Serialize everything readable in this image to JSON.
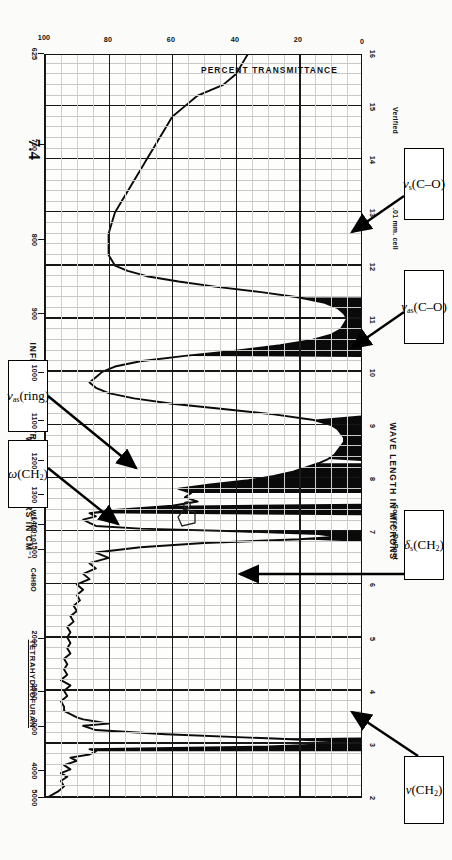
{
  "document": {
    "title": "INFRA-RED SPECTROGRAM",
    "compound_name": "TETRAHYDROFURAN",
    "formula": "C4H8O",
    "mol_wt_label": "Mol. Wt. 72.10",
    "mp_label": "MP 66.2-66.4°C",
    "source_label": "Source: DuPont",
    "cell_label": ".01 mm. cell",
    "verified_label": "Verified",
    "hand_marks": {
      "wavelength_note": "7.4"
    }
  },
  "axes": {
    "x_top": {
      "name": "WAVE NUMBERS IN CM⁻¹",
      "ticks": [
        "5000",
        "4000",
        "3000",
        "2500",
        "2000",
        "1500",
        "1400",
        "1300",
        "1200",
        "1100",
        "1000",
        "900",
        "800",
        "700",
        "625"
      ]
    },
    "x_bottom": {
      "name": "WAVE LENGTH IN MICRONS",
      "ticks": [
        "2",
        "3",
        "4",
        "5",
        "6",
        "7",
        "8",
        "9",
        "10",
        "11",
        "12",
        "13",
        "14",
        "15",
        "16"
      ]
    },
    "y": {
      "name": "PERCENT TRANSMITTANCE",
      "ticks": [
        "100",
        "80",
        "60",
        "40",
        "20",
        "0"
      ],
      "range": [
        0,
        100
      ]
    }
  },
  "annotations": [
    {
      "id": "nu-ch2",
      "label_html": "<i>ν</i>(CH<sub>2</sub>)",
      "plain": "nu(CH2)"
    },
    {
      "id": "delta-ch2",
      "label_html": "<i>δ</i><sub>s</sub>(CH<sub>2</sub>)",
      "plain": "delta_s(CH2)"
    },
    {
      "id": "omega-ch2",
      "label_html": "<i>ω</i>(CH<sub>2</sub>)",
      "plain": "omega(CH2)"
    },
    {
      "id": "nuas-ring",
      "label_html": "<i>ν</i><sub>as</sub>(ring)",
      "plain": "nu_as(ring)"
    },
    {
      "id": "nuas-co",
      "label_html": "<i>ν</i><sub>as</sub>(C–O)",
      "plain": "nu_as(C-O)"
    },
    {
      "id": "nus-co",
      "label_html": "<i>ν</i><sub>s</sub>(C–O)",
      "plain": "nu_s(C-O)"
    }
  ],
  "chart_data": {
    "type": "line",
    "title": "INFRA-RED SPECTROGRAM",
    "subtitle": "TETRAHYDROFURAN",
    "xlabel": "WAVE LENGTH IN MICRONS",
    "xlabel_secondary": "WAVE NUMBERS IN CM-1",
    "ylabel": "PERCENT TRANSMITTANCE",
    "xlim": [
      2,
      16
    ],
    "ylim": [
      0,
      100
    ],
    "grid": true,
    "legend": "none",
    "fill_below_curve": true,
    "x_unit": "microns",
    "y_unit": "percent transmittance",
    "x": [
      2.0,
      2.1,
      2.2,
      2.3,
      2.38,
      2.45,
      2.52,
      2.6,
      2.68,
      2.74,
      2.8,
      2.86,
      2.9,
      2.95,
      3.0,
      3.05,
      3.1,
      3.18,
      3.26,
      3.34,
      3.38,
      3.42,
      3.46,
      3.5,
      3.56,
      3.62,
      3.7,
      3.8,
      3.9,
      4.0,
      4.1,
      4.2,
      4.3,
      4.4,
      4.5,
      4.6,
      4.7,
      4.8,
      4.9,
      5.0,
      5.1,
      5.2,
      5.3,
      5.4,
      5.5,
      5.6,
      5.7,
      5.8,
      5.9,
      6.0,
      6.1,
      6.2,
      6.3,
      6.4,
      6.5,
      6.6,
      6.7,
      6.78,
      6.85,
      6.9,
      6.95,
      7.0,
      7.05,
      7.1,
      7.16,
      7.22,
      7.28,
      7.34,
      7.4,
      7.48,
      7.56,
      7.64,
      7.72,
      7.8,
      7.88,
      7.96,
      8.04,
      8.12,
      8.2,
      8.28,
      8.36,
      8.44,
      8.52,
      8.6,
      8.68,
      8.76,
      8.84,
      8.92,
      9.0,
      9.1,
      9.2,
      9.3,
      9.4,
      9.5,
      9.6,
      9.7,
      9.8,
      9.9,
      10.0,
      10.1,
      10.2,
      10.3,
      10.4,
      10.5,
      10.6,
      10.7,
      10.8,
      10.9,
      11.0,
      11.1,
      11.2,
      11.3,
      11.4,
      11.5,
      11.6,
      11.7,
      11.8,
      11.9,
      12.0,
      12.2,
      12.4,
      12.6,
      12.8,
      13.0,
      13.2,
      13.4,
      13.6,
      13.8,
      14.0,
      14.2,
      14.4,
      14.6,
      14.8,
      15.0,
      15.2,
      15.4,
      15.6,
      15.8,
      16.0
    ],
    "y": [
      99,
      96,
      94,
      95,
      93,
      95,
      92,
      94,
      90,
      92,
      86,
      84,
      86,
      30,
      8,
      9,
      28,
      62,
      84,
      88,
      80,
      84,
      88,
      90,
      92,
      94,
      94,
      95,
      93,
      94,
      92,
      95,
      93,
      94,
      93,
      94,
      92,
      93,
      92,
      93,
      92,
      93,
      91,
      92,
      90,
      91,
      89,
      90,
      88,
      90,
      86,
      88,
      84,
      86,
      80,
      84,
      70,
      50,
      20,
      8,
      14,
      40,
      70,
      84,
      86,
      88,
      84,
      86,
      78,
      60,
      52,
      56,
      54,
      58,
      48,
      36,
      28,
      22,
      18,
      14,
      11,
      9,
      8,
      7,
      6,
      6,
      7,
      8,
      10,
      16,
      28,
      44,
      60,
      72,
      80,
      84,
      86,
      84,
      82,
      78,
      70,
      56,
      40,
      26,
      16,
      10,
      7,
      6,
      5,
      6,
      8,
      12,
      20,
      32,
      46,
      58,
      68,
      74,
      78,
      80,
      80,
      80,
      79,
      78,
      76,
      74,
      72,
      70,
      68,
      66,
      64,
      62,
      60,
      56,
      52,
      44,
      40,
      38,
      36,
      34
    ],
    "strong_bands": [
      {
        "label": "nu(CH2)",
        "x_microns": 3.0,
        "wavenumber_cm-1": 3330,
        "transmittance_pct": 8,
        "x_range": [
          2.86,
          3.12
        ]
      },
      {
        "label": "delta_s(CH2)",
        "x_microns": 6.92,
        "wavenumber_cm-1": 1445,
        "transmittance_pct": 7,
        "x_range": [
          6.8,
          7.02
        ]
      },
      {
        "label": "omega(CH2)",
        "x_microns": 7.42,
        "wavenumber_cm-1": 1348,
        "transmittance_pct": 45,
        "x_range": [
          7.3,
          7.52
        ]
      },
      {
        "label": "nu_as(ring)",
        "x_microns": 7.9,
        "wavenumber_cm-1": 1266,
        "transmittance_pct": 30,
        "x_range": [
          7.72,
          8.28
        ]
      },
      {
        "label": "nu_as(C-O)",
        "x_microns": 8.78,
        "wavenumber_cm-1": 1139,
        "transmittance_pct": 5,
        "x_range": [
          8.32,
          9.18
        ]
      },
      {
        "label": "nu_s(C-O)",
        "x_microns": 10.98,
        "wavenumber_cm-1": 911,
        "transmittance_pct": 4,
        "x_range": [
          10.28,
          11.4
        ]
      }
    ]
  }
}
